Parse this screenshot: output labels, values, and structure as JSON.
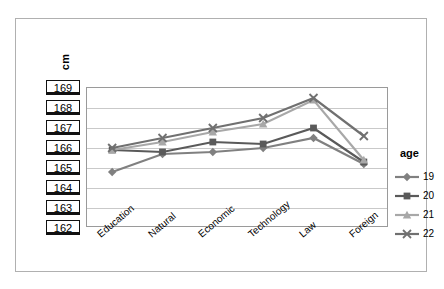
{
  "chart_data": {
    "type": "line",
    "title": "",
    "xlabel": "",
    "ylabel": "cm",
    "ylim": [
      162,
      169
    ],
    "ytick_labels": [
      "169",
      "168",
      "167",
      "166",
      "165",
      "164",
      "163",
      "162"
    ],
    "grid": true,
    "legend_position": "right",
    "legend_title": "age",
    "categories": [
      "Education",
      "Natural",
      "Economic",
      "Technology",
      "Law",
      "Foreign"
    ],
    "series": [
      {
        "name": "19",
        "marker": "diamond",
        "color": "#808080",
        "values": [
          164.8,
          165.7,
          165.8,
          166.0,
          166.5,
          165.2
        ]
      },
      {
        "name": "20",
        "marker": "square",
        "color": "#5a5a5a",
        "values": [
          165.9,
          165.8,
          166.3,
          166.2,
          167.0,
          165.3
        ]
      },
      {
        "name": "21",
        "marker": "triangle",
        "color": "#a8a8a8",
        "values": [
          165.9,
          166.3,
          166.8,
          167.2,
          168.4,
          165.4
        ]
      },
      {
        "name": "22",
        "marker": "cross",
        "color": "#707070",
        "values": [
          166.0,
          166.5,
          167.0,
          167.5,
          168.5,
          166.6
        ]
      }
    ]
  }
}
